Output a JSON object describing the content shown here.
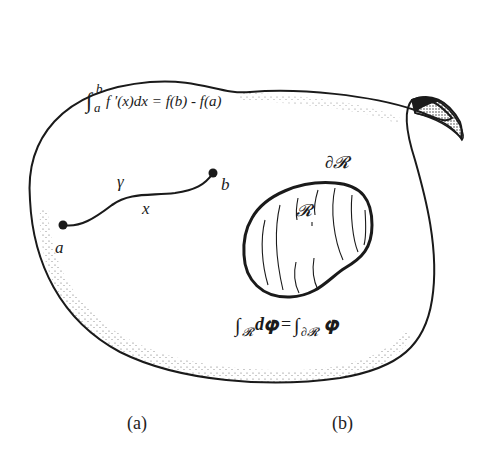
{
  "figure": {
    "formulas": {
      "fundamental_theorem": {
        "integral_sign": "∫",
        "upper_limit": "b",
        "lower_limit": "a",
        "integrand": "f ′(x)dx = f(b) - f(a)"
      },
      "stokes": {
        "lhs_sign": "∫",
        "lhs_sub": "𝓡",
        "lhs_body": "d𝛗",
        "equals": "=",
        "rhs_sign": "∫",
        "rhs_sub": "∂𝓡",
        "rhs_body": "𝛗"
      }
    },
    "path": {
      "start_label": "a",
      "end_label": "b",
      "curve_label": "γ",
      "point_label": "x"
    },
    "region": {
      "interior_label": "𝓡",
      "boundary_label": "∂𝓡"
    },
    "captions": [
      "(a)",
      "(b)"
    ]
  },
  "colors": {
    "ink": "#1a1a1a",
    "background": "#ffffff"
  }
}
